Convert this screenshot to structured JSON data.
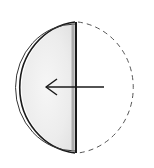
{
  "figure": {
    "colors": {
      "stroke": "#1a1a1a",
      "dashed": "#555555",
      "shade": "#e6e6e6",
      "background": "#ffffff"
    },
    "arrow_direction": "left"
  }
}
